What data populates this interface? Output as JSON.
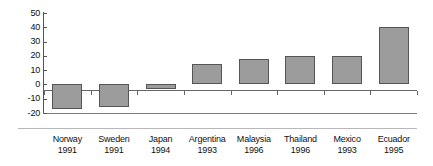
{
  "chart_data": {
    "type": "bar",
    "title": "",
    "subtitle": "",
    "xlabel": "",
    "ylabel": "",
    "categories": [
      "Norway",
      "Sweden",
      "Japan",
      "Argentina",
      "Malaysia",
      "Thailand",
      "Mexico",
      "Ecuador"
    ],
    "category_years": [
      "1991",
      "1991",
      "1994",
      "1993",
      "1996",
      "1996",
      "1993",
      "1995"
    ],
    "values": [
      -17,
      -16,
      -3,
      14,
      18,
      20,
      20,
      40
    ],
    "ylim": [
      -20,
      50
    ],
    "ytick_labels": [
      "50",
      "40",
      "30",
      "20",
      "10",
      "0",
      "-10",
      "-20"
    ],
    "ytick_values": [
      50,
      40,
      30,
      20,
      10,
      0,
      -10,
      -20
    ],
    "grid": false,
    "legend": null,
    "bar_color": "#9c9c9c",
    "bar_border_color": "#555555",
    "axis_color": "#555555",
    "zero_line_color": "#666666",
    "text_color": "#111111"
  }
}
